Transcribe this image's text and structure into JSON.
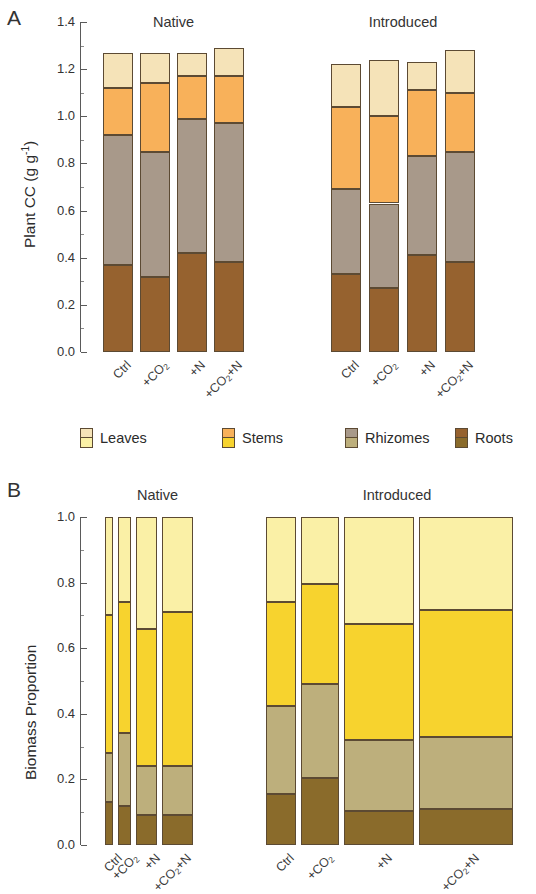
{
  "figure": {
    "panel_a_letter": "A",
    "panel_b_letter": "B",
    "group_titles": [
      "Native",
      "Introduced"
    ]
  },
  "legend": {
    "items": [
      {
        "label": "Leaves",
        "color_a": "#F5E3B8",
        "color_b": "#FAF0A6"
      },
      {
        "label": "Stems",
        "color_a": "#F8B15A",
        "color_b": "#F7D32E"
      },
      {
        "label": "Rhizomes",
        "color_a": "#A8998A",
        "color_b": "#BDAF7C"
      },
      {
        "label": "Roots",
        "color_a": "#96622F",
        "color_b": "#8A6B2B"
      }
    ]
  },
  "colors": {
    "outline": "#5c4a33",
    "axis": "#5a5a5a",
    "text": "#2b2b2b"
  },
  "chart_data": [
    {
      "id": "panel-a",
      "type": "bar",
      "title": "A",
      "ylabel": "Plant CC (g g⁻¹)",
      "ylabel_plain": "Plant CC (g g-1)",
      "xlabel": "",
      "ylim": [
        0.0,
        1.4
      ],
      "yticks": [
        0.0,
        0.2,
        0.4,
        0.6,
        0.8,
        1.0,
        1.2,
        1.4
      ],
      "ytick_labels": [
        "0.0",
        "0.2",
        "0.4",
        "0.6",
        "0.8",
        "1.0",
        "1.2",
        "1.4"
      ],
      "grid": false,
      "stacked": true,
      "legend_position": "below-panel",
      "groups": [
        "Native",
        "Introduced"
      ],
      "categories": [
        "Ctrl",
        "+CO2",
        "+N",
        "+CO2+N"
      ],
      "category_labels_html": [
        "Ctrl",
        "+CO<sub>2</sub>",
        "+N",
        "+CO<sub>2</sub>+N"
      ],
      "series_order": [
        "Roots",
        "Rhizomes",
        "Stems",
        "Leaves"
      ],
      "series": [
        {
          "name": "Roots",
          "group": "Native",
          "values": [
            0.37,
            0.32,
            0.42,
            0.38
          ]
        },
        {
          "name": "Rhizomes",
          "group": "Native",
          "values": [
            0.55,
            0.53,
            0.57,
            0.59
          ]
        },
        {
          "name": "Stems",
          "group": "Native",
          "values": [
            0.2,
            0.29,
            0.18,
            0.2
          ]
        },
        {
          "name": "Leaves",
          "group": "Native",
          "values": [
            0.15,
            0.13,
            0.1,
            0.12
          ]
        },
        {
          "name": "Roots",
          "group": "Introduced",
          "values": [
            0.33,
            0.27,
            0.41,
            0.38
          ]
        },
        {
          "name": "Rhizomes",
          "group": "Introduced",
          "values": [
            0.36,
            0.36,
            0.42,
            0.47
          ]
        },
        {
          "name": "Stems",
          "group": "Introduced",
          "values": [
            0.35,
            0.37,
            0.28,
            0.25
          ]
        },
        {
          "name": "Leaves",
          "group": "Introduced",
          "values": [
            0.18,
            0.24,
            0.12,
            0.18
          ]
        }
      ],
      "totals": {
        "Native": [
          1.27,
          1.27,
          1.27,
          1.29
        ],
        "Introduced": [
          1.22,
          1.24,
          1.23,
          1.28
        ]
      }
    },
    {
      "id": "panel-b",
      "type": "bar",
      "title": "B",
      "ylabel": "Biomass Proportion",
      "xlabel": "",
      "ylim": [
        0.0,
        1.0
      ],
      "yticks": [
        0.0,
        0.2,
        0.4,
        0.6,
        0.8,
        1.0
      ],
      "ytick_labels": [
        "0.0",
        "0.2",
        "0.4",
        "0.6",
        "0.8",
        "1.0"
      ],
      "grid": false,
      "stacked": true,
      "normalized": true,
      "mosaic_variable_width": true,
      "legend_position": "above-panel",
      "groups": [
        "Native",
        "Introduced"
      ],
      "categories": [
        "Ctrl",
        "+CO2",
        "+N",
        "+CO2+N"
      ],
      "category_labels_html": [
        "Ctrl",
        "+CO<sub>2</sub>",
        "+N",
        "+CO<sub>2</sub>+N"
      ],
      "series_order": [
        "Roots",
        "Rhizomes",
        "Stems",
        "Leaves"
      ],
      "series": [
        {
          "name": "Roots",
          "group": "Native",
          "values": [
            0.13,
            0.12,
            0.09,
            0.09
          ]
        },
        {
          "name": "Rhizomes",
          "group": "Native",
          "values": [
            0.15,
            0.22,
            0.15,
            0.15
          ]
        },
        {
          "name": "Stems",
          "group": "Native",
          "values": [
            0.42,
            0.4,
            0.42,
            0.47
          ]
        },
        {
          "name": "Leaves",
          "group": "Native",
          "values": [
            0.3,
            0.26,
            0.34,
            0.29
          ]
        },
        {
          "name": "Roots",
          "group": "Introduced",
          "values": [
            0.155,
            0.205,
            0.105,
            0.11
          ]
        },
        {
          "name": "Rhizomes",
          "group": "Introduced",
          "values": [
            0.27,
            0.285,
            0.215,
            0.22
          ]
        },
        {
          "name": "Stems",
          "group": "Introduced",
          "values": [
            0.315,
            0.305,
            0.355,
            0.385
          ]
        },
        {
          "name": "Leaves",
          "group": "Introduced",
          "values": [
            0.26,
            0.205,
            0.325,
            0.285
          ]
        }
      ],
      "bar_widths": {
        "Native": [
          8,
          13,
          21,
          31
        ],
        "Introduced": [
          30,
          38,
          70,
          94
        ]
      },
      "cumulative_tops": {
        "Native": [
          [
            0.13,
            0.28,
            0.7,
            1.0
          ],
          [
            0.12,
            0.34,
            0.745,
            1.0
          ],
          [
            0.09,
            0.24,
            0.665,
            1.0
          ],
          [
            0.09,
            0.24,
            0.71,
            1.0
          ]
        ],
        "Introduced": [
          [
            0.155,
            0.425,
            0.74,
            1.0
          ],
          [
            0.205,
            0.49,
            0.795,
            1.0
          ],
          [
            0.105,
            0.32,
            0.675,
            1.0
          ],
          [
            0.11,
            0.33,
            0.715,
            1.0
          ]
        ]
      }
    }
  ]
}
